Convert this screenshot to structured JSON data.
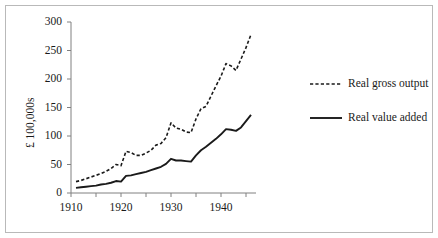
{
  "figure": {
    "border_color": "#b9b9b9",
    "background": "#ffffff",
    "ink_color": "#1a1a1a",
    "axis_color": "#808080"
  },
  "axes": {
    "y_label": "£ 100,000s",
    "y_ticks": [
      "0",
      "50",
      "100",
      "150",
      "200",
      "250",
      "300"
    ],
    "x_ticks": [
      "1910",
      "1920",
      "1930",
      "1940"
    ],
    "x_minor_ticks": [
      "1915",
      "1925",
      "1935",
      "1945"
    ]
  },
  "legend": {
    "position": "right",
    "items": [
      {
        "label": "Real gross output",
        "style": "dashed"
      },
      {
        "label": "Real value added",
        "style": "solid"
      }
    ]
  },
  "chart_data": {
    "type": "line",
    "title": "",
    "xlabel": "",
    "ylabel": "£ 100,000s",
    "xlim": [
      1910,
      1946
    ],
    "ylim": [
      0,
      300
    ],
    "grid": false,
    "legend_position": "right",
    "x": [
      1911,
      1912,
      1913,
      1914,
      1915,
      1916,
      1917,
      1918,
      1919,
      1920,
      1921,
      1922,
      1923,
      1924,
      1925,
      1926,
      1927,
      1928,
      1929,
      1930,
      1931,
      1932,
      1933,
      1934,
      1935,
      1936,
      1937,
      1938,
      1939,
      1940,
      1941,
      1942,
      1943,
      1944,
      1945,
      1946
    ],
    "series": [
      {
        "name": "Real gross output",
        "style": "dashed",
        "values": [
          20,
          22,
          25,
          28,
          31,
          34,
          38,
          43,
          50,
          48,
          73,
          71,
          66,
          66,
          70,
          75,
          84,
          87,
          97,
          123,
          114,
          112,
          107,
          106,
          130,
          148,
          152,
          170,
          188,
          205,
          227,
          223,
          215,
          235,
          255,
          278
        ]
      },
      {
        "name": "Real value added",
        "style": "solid",
        "values": [
          9,
          10,
          11,
          12,
          13,
          15,
          16,
          18,
          21,
          20,
          30,
          31,
          33,
          35,
          37,
          40,
          43,
          46,
          51,
          60,
          57,
          57,
          56,
          55,
          66,
          75,
          81,
          88,
          95,
          103,
          112,
          111,
          109,
          115,
          126,
          137
        ]
      }
    ]
  }
}
